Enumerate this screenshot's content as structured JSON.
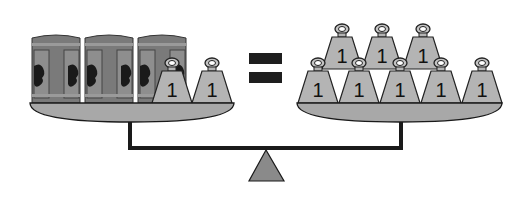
{
  "colors": {
    "outline": "#1a1a1a",
    "pan": "#a8a8a8",
    "weight": "#b4b4b4",
    "can_body": "#7a7a7a",
    "can_label": "#9a9a9a",
    "fulcrum": "#8a8a8a",
    "equals": "#1e1e1e"
  },
  "left_pan": {
    "cans": [
      {
        "label": "can"
      },
      {
        "label": "can"
      },
      {
        "label": "can"
      }
    ],
    "weights": [
      {
        "value": "1"
      },
      {
        "value": "1"
      }
    ]
  },
  "equals_sign": "=",
  "right_pan": {
    "top_row": [
      {
        "value": "1"
      },
      {
        "value": "1"
      },
      {
        "value": "1"
      }
    ],
    "bottom_row": [
      {
        "value": "1"
      },
      {
        "value": "1"
      },
      {
        "value": "1"
      },
      {
        "value": "1"
      },
      {
        "value": "1"
      }
    ]
  }
}
